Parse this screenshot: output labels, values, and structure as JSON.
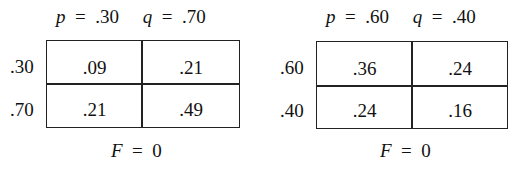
{
  "tables": [
    {
      "header": {
        "p_label": "p",
        "p_value": ".30",
        "q_label": "q",
        "q_value": ".70"
      },
      "rows": [
        {
          "label": ".30",
          "cells": [
            ".09",
            ".21"
          ]
        },
        {
          "label": ".70",
          "cells": [
            ".21",
            ".49"
          ]
        }
      ],
      "footer": {
        "var": "F",
        "value": "0"
      }
    },
    {
      "header": {
        "p_label": "p",
        "p_value": ".60",
        "q_label": "q",
        "q_value": ".40"
      },
      "rows": [
        {
          "label": ".60",
          "cells": [
            ".36",
            ".24"
          ]
        },
        {
          "label": ".40",
          "cells": [
            ".24",
            ".16"
          ]
        }
      ],
      "footer": {
        "var": "F",
        "value": "0"
      }
    }
  ]
}
